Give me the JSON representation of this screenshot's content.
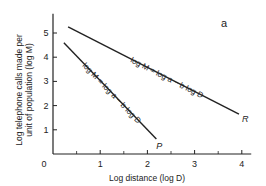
{
  "chart_data": {
    "type": "line",
    "title": "",
    "panel_label": "a",
    "xlabel": "Log distance (log D)",
    "ylabel_line1": "Log telephone calls made per",
    "ylabel_line2": "unit of population (log M)",
    "xlim": [
      0,
      4.2
    ],
    "ylim": [
      0,
      5.8
    ],
    "x_ticks": [
      1,
      2,
      3,
      4
    ],
    "x_minor_ticks": [
      0.5,
      1.5,
      2.5,
      3.5
    ],
    "y_ticks": [
      1,
      2,
      3,
      4,
      5
    ],
    "origin_label": "0",
    "grid": false,
    "series": [
      {
        "name": "R",
        "equation": "log M = log a − b log D",
        "x": [
          0.32,
          3.94
        ],
        "y": [
          5.25,
          1.65
        ]
      },
      {
        "name": "P",
        "equation": "log M = log a − b log D",
        "x": [
          0.23,
          2.19
        ],
        "y": [
          4.6,
          0.62
        ]
      }
    ]
  }
}
